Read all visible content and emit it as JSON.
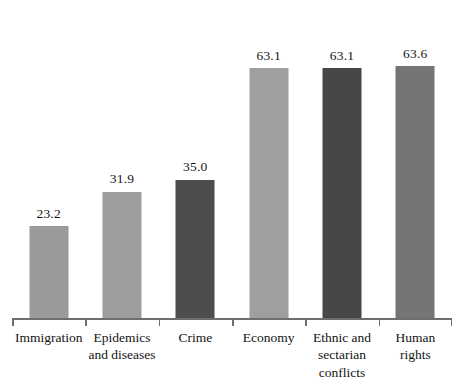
{
  "chart_data": {
    "type": "bar",
    "title": "",
    "subtitle": "",
    "xlabel": "",
    "ylabel": "",
    "ylim": [
      0,
      70
    ],
    "grid": false,
    "legend": false,
    "orientation": "vertical",
    "value_labels_shown": true,
    "categories": [
      "Immigration",
      "Epidemics and diseases",
      "Crime",
      "Economy",
      "Ethnic and sectarian conflicts",
      "Human rights"
    ],
    "values": [
      23.2,
      31.9,
      35.0,
      63.1,
      63.1,
      63.6
    ],
    "value_labels": [
      "23.2",
      "31.9",
      "35.0",
      "63.1",
      "63.1",
      "63.6"
    ],
    "bar_colors": [
      "#9a9a9a",
      "#9d9d9d",
      "#4d4d4d",
      "#9f9f9f",
      "#474747",
      "#757575"
    ]
  },
  "bars": [
    {
      "category": "Immigration",
      "value": 23.2,
      "label": "23.2",
      "color": "#9a9a9a",
      "label_lines": [
        "Immigration"
      ]
    },
    {
      "category": "Epidemics and diseases",
      "value": 31.9,
      "label": "31.9",
      "color": "#9d9d9d",
      "label_lines": [
        "Epidemics",
        "and diseases"
      ]
    },
    {
      "category": "Crime",
      "value": 35.0,
      "label": "35.0",
      "color": "#4d4d4d",
      "label_lines": [
        "Crime"
      ]
    },
    {
      "category": "Economy",
      "value": 63.1,
      "label": "63.1",
      "color": "#9f9f9f",
      "label_lines": [
        "Economy"
      ]
    },
    {
      "category": "Ethnic and sectarian conflicts",
      "value": 63.1,
      "label": "63.1",
      "color": "#474747",
      "label_lines": [
        "Ethnic and",
        "sectarian",
        "conflicts"
      ]
    },
    {
      "category": "Human rights",
      "value": 63.6,
      "label": "63.6",
      "color": "#757575",
      "label_lines": [
        "Human",
        "rights"
      ]
    }
  ],
  "axis": {
    "line_color": "#6e6e6e",
    "tick_count": 7
  }
}
